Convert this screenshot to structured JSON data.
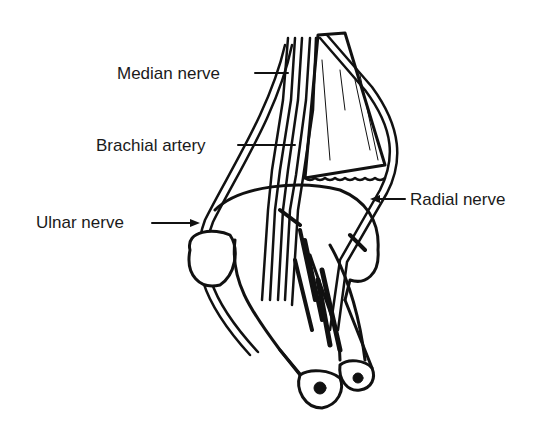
{
  "diagram": {
    "labels": {
      "median_nerve": "Median nerve",
      "brachial_artery": "Brachial artery",
      "ulnar_nerve": "Ulnar nerve",
      "radial_nerve": "Radial nerve"
    },
    "colors": {
      "ink": "#111111",
      "background": "#ffffff"
    }
  }
}
